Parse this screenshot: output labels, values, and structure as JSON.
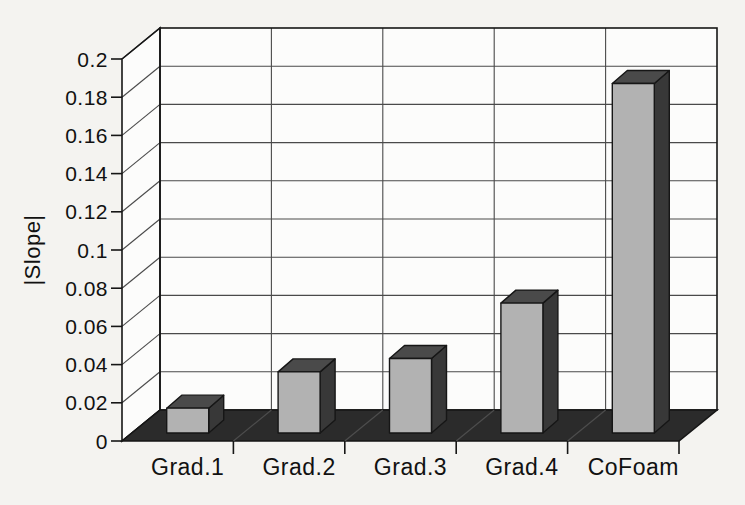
{
  "chart_data": {
    "type": "bar",
    "style": "3d-column",
    "title": "",
    "xlabel": "",
    "ylabel": "|Slope|",
    "categories": [
      "Grad.1",
      "Grad.2",
      "Grad.3",
      "Grad.4",
      "CoFoam"
    ],
    "values": [
      0.013,
      0.032,
      0.039,
      0.068,
      0.183
    ],
    "ylim": [
      0,
      0.2
    ],
    "ytick_step": 0.02,
    "ytick_labels": [
      "0",
      "0.02",
      "0.04",
      "0.06",
      "0.08",
      "0.1",
      "0.12",
      "0.14",
      "0.16",
      "0.18",
      "0.2"
    ],
    "grid": true,
    "legend": "none",
    "colors": {
      "page_background": "#f4f3f0",
      "wall": "#fcfcfb",
      "gridline": "#4a4a4a",
      "outline": "#161616",
      "floor": "#2b2b2b",
      "floor_divider": "#4d4d4d",
      "bar_front": "#b2b2b2",
      "bar_top": "#4a4a4a",
      "bar_side": "#383838",
      "text": "#111111"
    }
  }
}
